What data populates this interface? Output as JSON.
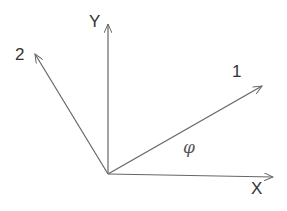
{
  "diagram": {
    "type": "coordinate-axes",
    "labels": {
      "y_axis": "Y",
      "x_axis": "X",
      "axis_1": "1",
      "axis_2": "2",
      "angle": "φ"
    },
    "stroke_color": "#666666",
    "text_color": "#333333"
  }
}
